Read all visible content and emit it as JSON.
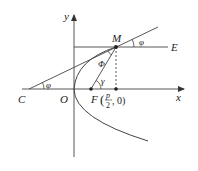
{
  "diagram": {
    "labels": {
      "y_axis": "y",
      "x_axis": "x",
      "origin": "O",
      "point_C": "C",
      "point_M": "M",
      "point_E": "E",
      "point_F": "F",
      "focus_coord_num": "p",
      "focus_coord_den": "2",
      "focus_coord_rest": ", 0)",
      "focus_open_paren": "(",
      "angle_phi_left": "φ",
      "angle_phi_right": "φ",
      "angle_Phi": "Φ",
      "angle_gamma": "γ"
    },
    "colors": {
      "line": "#333333",
      "background": "#ffffff"
    }
  }
}
